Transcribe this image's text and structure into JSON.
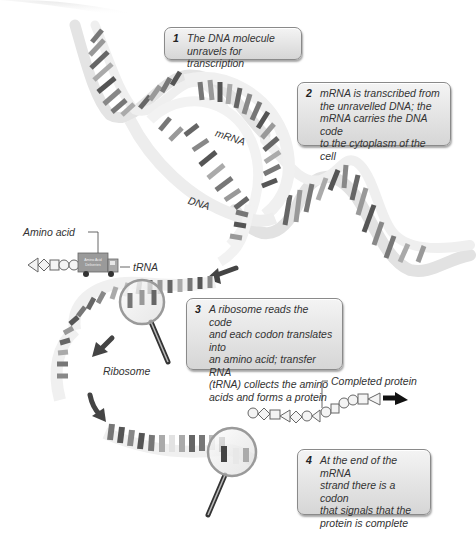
{
  "diagram": {
    "steps": [
      {
        "number": "1",
        "text": "The DNA molecule\nunravels for transcription"
      },
      {
        "number": "2",
        "text": "mRNA is transcribed from\nthe unravelled DNA; the\nmRNA carries the DNA code\nto the cytoplasm of the cell"
      },
      {
        "number": "3",
        "text": "A ribosome reads the code\nand each codon translates into\nan amino acid; transfer RNA\n(tRNA) collects the amino\nacids and forms a protein"
      },
      {
        "number": "4",
        "text": "At the end of the mRNA\nstrand there is a codon\nthat signals that the\nprotein is complete"
      }
    ],
    "labels": {
      "mrna": "mRNA",
      "dna": "DNA",
      "amino_acid": "Amino acid",
      "trna": "tRNA",
      "ribosome": "Ribosome",
      "completed_protein": "Completed protein",
      "truck_text_line1": "Amino Acid",
      "truck_text_line2": "Deliveries"
    },
    "icons": [
      "dna-helix",
      "mrna-strand",
      "magnifying-glass",
      "delivery-truck",
      "amino-acid-chain",
      "arrow"
    ],
    "colors": {
      "box_border": "#8a8a8a",
      "box_fill": "#e4e4e4",
      "base_dark": "#555555",
      "base_mid": "#8c8c8c",
      "base_light": "#c2c2c2",
      "backbone": "#eeeeee",
      "arrow": "#444444"
    }
  }
}
